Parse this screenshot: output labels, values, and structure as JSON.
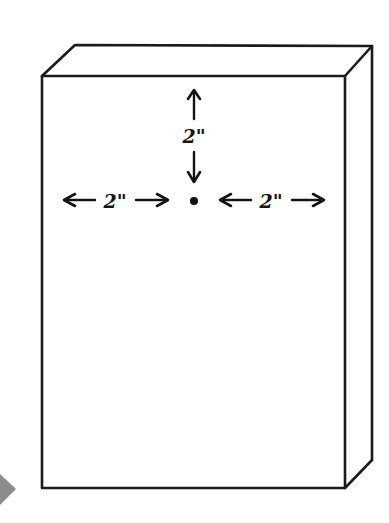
{
  "page": {
    "background_color": "#ffffff",
    "width": 389,
    "height": 523,
    "alt_description": "Hand drawn isometric box with center point measurements"
  },
  "diagram": {
    "ink_color": "#1b1b1b",
    "face_color": "#ffffff",
    "view": "isometric-three-quarter",
    "faces": [
      {
        "name": "front-face",
        "label": "front"
      },
      {
        "name": "top-face",
        "label": "top"
      },
      {
        "name": "right-side-face",
        "label": "right side"
      }
    ]
  },
  "measurements": {
    "vertical": {
      "name": "vertical-measurement",
      "label": "2\"",
      "value": 2,
      "unit": "inch",
      "from": "top-edge",
      "to": "center-point",
      "arrow_start": "up",
      "arrow_end": "down"
    },
    "left_horizontal": {
      "name": "left-horizontal-measurement",
      "label": "2\"",
      "value": 2,
      "unit": "inch",
      "from": "left-edge",
      "to": "center-point",
      "arrow_start": "left",
      "arrow_end": "right"
    },
    "right_horizontal": {
      "name": "right-horizontal-measurement",
      "label": "2\"",
      "value": 2,
      "unit": "inch",
      "from": "center-point",
      "to": "right-edge",
      "arrow_start": "left",
      "arrow_end": "right"
    }
  },
  "center_mark": {
    "name": "center-point-dot",
    "label": "",
    "color": "#101010",
    "radius": 4
  },
  "scroll_indicator": {
    "name": "scroll-chevron-left",
    "glyph": "right-triangle",
    "color": "#8c8c8c"
  }
}
